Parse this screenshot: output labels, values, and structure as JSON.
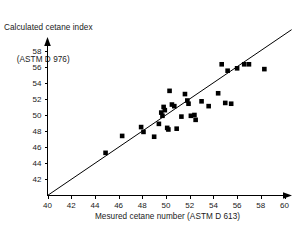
{
  "chart_data": {
    "type": "scatter",
    "title": "",
    "ylabel_line1": "Calculated cetane index",
    "ylabel_line2": "(ASTM D 976)",
    "xlabel": "Mesured cetane number (ASTM D 613)",
    "xlim": [
      40,
      61
    ],
    "ylim": [
      40.2,
      59
    ],
    "xticks": [
      40,
      42,
      44,
      46,
      48,
      50,
      52,
      54,
      56,
      58,
      60
    ],
    "yticks": [
      42,
      44,
      46,
      48,
      50,
      52,
      54,
      56,
      58
    ],
    "xtick_labels": [
      "40",
      "42",
      "44",
      "46",
      "48",
      "50",
      "52",
      "54",
      "56",
      "58",
      "60"
    ],
    "ytick_labels": [
      "42",
      "44",
      "46",
      "48",
      "50",
      "52",
      "54",
      "56",
      "58"
    ],
    "grid": false,
    "legend": null,
    "reference_line": {
      "name": "identity-line",
      "x": [
        40.0,
        60.6
      ],
      "y": [
        40.0,
        60.6
      ],
      "slope": 1,
      "intercept": 0
    },
    "points": [
      {
        "x": 44.9,
        "y": 45.3
      },
      {
        "x": 46.3,
        "y": 47.4
      },
      {
        "x": 47.9,
        "y": 48.5
      },
      {
        "x": 48.1,
        "y": 47.9
      },
      {
        "x": 49.0,
        "y": 47.3
      },
      {
        "x": 49.4,
        "y": 48.9
      },
      {
        "x": 49.6,
        "y": 50.3
      },
      {
        "x": 49.7,
        "y": 49.9
      },
      {
        "x": 49.8,
        "y": 51.0
      },
      {
        "x": 49.9,
        "y": 50.6
      },
      {
        "x": 50.1,
        "y": 48.4
      },
      {
        "x": 50.2,
        "y": 48.2
      },
      {
        "x": 50.3,
        "y": 53.0
      },
      {
        "x": 50.5,
        "y": 51.3
      },
      {
        "x": 50.7,
        "y": 51.1
      },
      {
        "x": 50.9,
        "y": 48.3
      },
      {
        "x": 51.3,
        "y": 49.8
      },
      {
        "x": 51.6,
        "y": 52.6
      },
      {
        "x": 51.8,
        "y": 51.8
      },
      {
        "x": 51.9,
        "y": 51.4
      },
      {
        "x": 52.1,
        "y": 49.9
      },
      {
        "x": 52.4,
        "y": 50.0
      },
      {
        "x": 52.5,
        "y": 49.4
      },
      {
        "x": 53.0,
        "y": 51.7
      },
      {
        "x": 53.6,
        "y": 51.1
      },
      {
        "x": 54.4,
        "y": 52.7
      },
      {
        "x": 54.7,
        "y": 56.3
      },
      {
        "x": 55.0,
        "y": 51.5
      },
      {
        "x": 55.2,
        "y": 55.5
      },
      {
        "x": 55.5,
        "y": 51.4
      },
      {
        "x": 56.0,
        "y": 55.8
      },
      {
        "x": 56.6,
        "y": 56.3
      },
      {
        "x": 57.0,
        "y": 56.3
      },
      {
        "x": 58.3,
        "y": 55.7
      }
    ]
  },
  "colors": {
    "axis": "#000000",
    "point": "#000000",
    "line": "#000000",
    "text": "#1a1a1a",
    "background": "#ffffff"
  }
}
